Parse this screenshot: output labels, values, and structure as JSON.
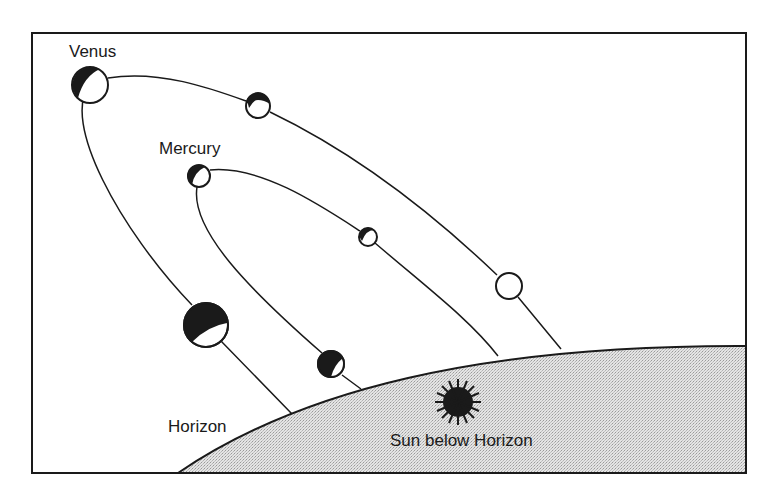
{
  "labels": {
    "venus": "Venus",
    "mercury": "Mercury",
    "horizon": "Horizon",
    "sun": "Sun below Horizon"
  },
  "colors": {
    "ink": "#1a1a1a",
    "ground": "#d9d9d9",
    "background": "#ffffff"
  },
  "venus_positions": [
    {
      "x": 90,
      "y": 85,
      "r": 18,
      "phase": "gibbous-lit-right"
    },
    {
      "x": 258,
      "y": 106,
      "r": 12,
      "phase": "gibbous-lit-bottom"
    },
    {
      "x": 509,
      "y": 286,
      "r": 13,
      "phase": "full"
    },
    {
      "x": 206,
      "y": 325,
      "r": 22,
      "phase": "crescent"
    }
  ],
  "mercury_positions": [
    {
      "x": 199,
      "y": 176,
      "r": 11,
      "phase": "gibbous-lit-right"
    },
    {
      "x": 368,
      "y": 237,
      "r": 9,
      "phase": "gibbous-lit-bottom"
    },
    {
      "x": 331,
      "y": 364,
      "r": 13,
      "phase": "crescent"
    }
  ]
}
